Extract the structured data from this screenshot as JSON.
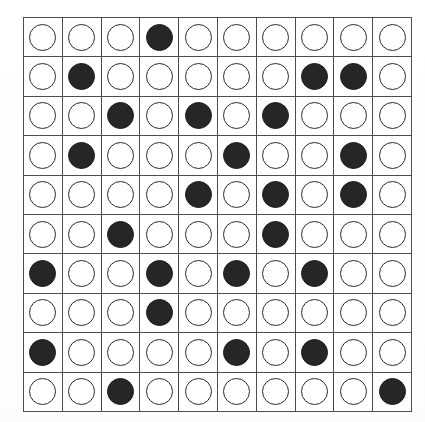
{
  "page": {
    "background_color": "#fdfdfc",
    "grid_line_color": "#4d4d4d"
  },
  "legend": {
    "empty_label": "empty circle",
    "filled_label": "filled circle",
    "empty_icon": "circle-outline-icon",
    "filled_icon": "circle-filled-icon",
    "empty_color": "#ffffff",
    "filled_color": "#262626"
  },
  "chart_data": {
    "type": "heatmap",
    "xlabel": "",
    "ylabel": "",
    "rows": 10,
    "columns": 10,
    "row_labels": [
      "1",
      "2",
      "3",
      "4",
      "5",
      "6",
      "7",
      "8",
      "9",
      "10"
    ],
    "column_labels": [
      "1",
      "2",
      "3",
      "4",
      "5",
      "6",
      "7",
      "8",
      "9",
      "10"
    ],
    "value_meaning": {
      "0": "empty circle",
      "1": "filled circle"
    },
    "filled_count": 26,
    "empty_count": 74,
    "filled_positions": [
      [
        1,
        4
      ],
      [
        2,
        2
      ],
      [
        2,
        8
      ],
      [
        2,
        9
      ],
      [
        3,
        3
      ],
      [
        3,
        5
      ],
      [
        3,
        7
      ],
      [
        4,
        2
      ],
      [
        4,
        6
      ],
      [
        4,
        9
      ],
      [
        5,
        5
      ],
      [
        5,
        7
      ],
      [
        5,
        9
      ],
      [
        6,
        3
      ],
      [
        6,
        7
      ],
      [
        7,
        1
      ],
      [
        7,
        4
      ],
      [
        7,
        6
      ],
      [
        7,
        8
      ],
      [
        8,
        4
      ],
      [
        9,
        1
      ],
      [
        9,
        6
      ],
      [
        9,
        8
      ],
      [
        10,
        3
      ],
      [
        10,
        10
      ]
    ],
    "values": [
      [
        0,
        0,
        0,
        1,
        0,
        0,
        0,
        0,
        0,
        0
      ],
      [
        0,
        1,
        0,
        0,
        0,
        0,
        0,
        1,
        1,
        0
      ],
      [
        0,
        0,
        1,
        0,
        1,
        0,
        1,
        0,
        0,
        0
      ],
      [
        0,
        1,
        0,
        0,
        0,
        1,
        0,
        0,
        1,
        0
      ],
      [
        0,
        0,
        0,
        0,
        1,
        0,
        1,
        0,
        1,
        0
      ],
      [
        0,
        0,
        1,
        0,
        0,
        0,
        1,
        0,
        0,
        0
      ],
      [
        1,
        0,
        0,
        1,
        0,
        1,
        0,
        1,
        0,
        0
      ],
      [
        0,
        0,
        0,
        1,
        0,
        0,
        0,
        0,
        0,
        0
      ],
      [
        1,
        0,
        0,
        0,
        0,
        1,
        0,
        1,
        0,
        0
      ],
      [
        0,
        0,
        1,
        0,
        0,
        0,
        0,
        0,
        0,
        1
      ]
    ],
    "row_filled_counts": [
      1,
      3,
      3,
      3,
      3,
      2,
      4,
      1,
      3,
      2
    ],
    "column_filled_counts": [
      2,
      2,
      3,
      3,
      2,
      3,
      3,
      3,
      3,
      1
    ],
    "grid": true,
    "legend_position": "none"
  }
}
